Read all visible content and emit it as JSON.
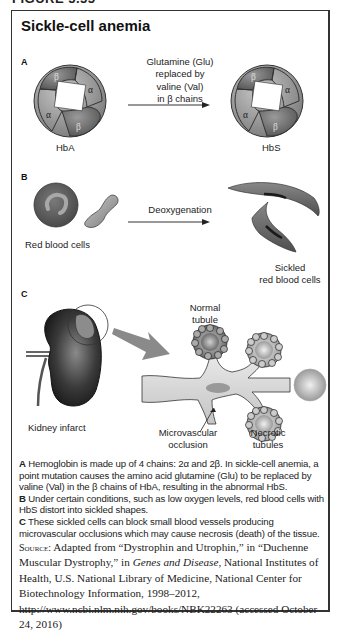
{
  "figure": {
    "heading": "FIGURE 5.55",
    "title": "Sickle-cell anemia"
  },
  "section_a": {
    "label": "A",
    "arrow_text": [
      "Glutamine (Glu)",
      "replaced by",
      "valine (Val)",
      "in β chains"
    ],
    "left_molecule": {
      "name": "HbA",
      "subunits": [
        "β",
        "α",
        "α",
        "β"
      ]
    },
    "right_molecule": {
      "name": "HbS",
      "subunits": [
        "β",
        "α",
        "α",
        "β"
      ]
    }
  },
  "section_b": {
    "label": "B",
    "arrow_text": "Deoxygenation",
    "left_label": "Red blood cells",
    "right_label_line1": "Sickled",
    "right_label_line2": "red blood cells"
  },
  "section_c": {
    "label": "C",
    "kidney_label": "Kidney infarct",
    "normal_label_line1": "Normal",
    "normal_label_line2": "tubule",
    "occlusion_label_line1": "Microvascular",
    "occlusion_label_line2": "occlusion",
    "necrotic_label_line1": "Necrotic",
    "necrotic_label_line2": "tubules"
  },
  "caption": {
    "a_label": "A",
    "a_text": " Hemoglobin is made up of 4 chains: 2α and 2β. In sickle-cell anemia, a point mutation causes the amino acid glutamine (Glu) to be replaced by valine (Val) in the β chains of HbA, resulting in the abnormal HbS.",
    "b_label": "B",
    "b_text": " Under certain conditions, such as low oxygen levels, red blood cells with HbS distort into sickled shapes.",
    "c_label": "C",
    "c_text": " These sickled cells can block small blood vessels producing microvascular occlusions which may cause necrosis (death) of the tissue."
  },
  "source": {
    "label": "Source:",
    "text_1": " Adapted from “Dystrophin and Utrophin,” in “Duchenne Muscular Dystrophy,” in ",
    "italic": "Genes and Disease",
    "text_2": ", National Institutes of Health, U.S. National Library of Medicine, National Center for Biotechnology Information, 1998–2012, http://www.ncbi.nlm.nih.gov/books/NBK22263 (accessed October 24, 2016)"
  },
  "colors": {
    "beta_subunit": "#6e6e6e",
    "alpha_subunit": "#9a9a9a",
    "rbc": "#6a6a6a",
    "border": "#333333"
  }
}
